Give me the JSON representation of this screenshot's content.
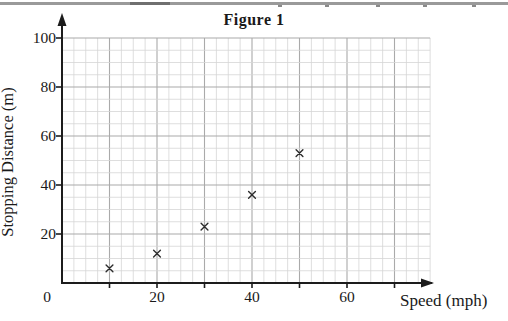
{
  "figure": {
    "title": "Figure 1"
  },
  "chart_data": {
    "type": "scatter",
    "title": "Figure 1",
    "xlabel": "Speed (mph)",
    "ylabel": "Stopping Distance (m)",
    "x": [
      10,
      20,
      30,
      40,
      50
    ],
    "y": [
      6,
      12,
      23,
      36,
      53
    ],
    "marker": "x",
    "xlim": [
      0,
      77.5
    ],
    "ylim": [
      0,
      100
    ],
    "x_tick_interval": 10,
    "x_label_interval": 20,
    "y_tick_interval": 20,
    "y_label_interval": 20,
    "minor_divisions_per_major": 4,
    "x_tick_labels": [
      "20",
      "40",
      "60"
    ],
    "y_tick_labels": [
      "20",
      "40",
      "60",
      "80",
      "100"
    ],
    "origin_label": "0",
    "grid": true,
    "legend": "none",
    "colors": {
      "minor_grid": "#d6d6d6",
      "major_grid": "#aaaaaa",
      "axis": "#1c1c1c",
      "marker": "#2e2e2e",
      "text": "#1a1a1a",
      "page_edge": "#9a9a9a"
    }
  }
}
